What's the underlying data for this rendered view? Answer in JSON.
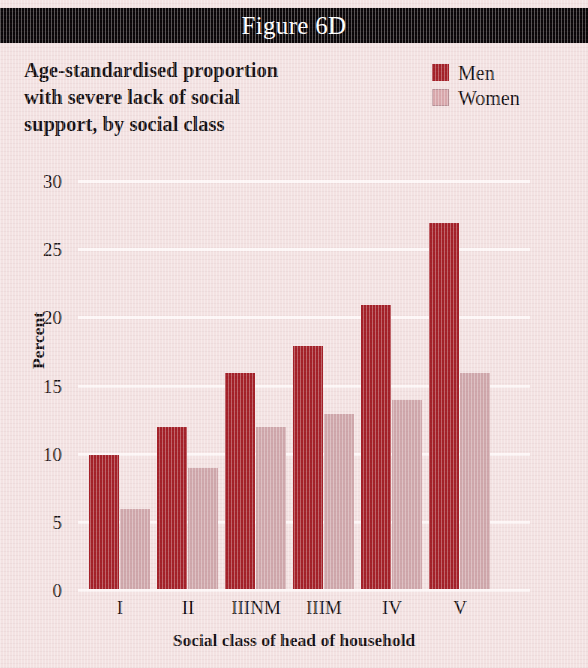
{
  "banner": {
    "title": "Figure 6D"
  },
  "subtitle": {
    "lines": [
      "Age-standardised proportion",
      "with severe lack of social",
      "support, by social class"
    ]
  },
  "legend": {
    "position": "top-right",
    "entries": [
      {
        "label": "Men",
        "color": "#a32028"
      },
      {
        "label": "Women",
        "color": "#d9a8ac"
      }
    ]
  },
  "colors": {
    "background": "#f3e2e2",
    "banner": "#0a0608",
    "gridline": "#fdf6f6",
    "men": "#a32028",
    "women": "#cfa7ab",
    "text": "#161012"
  },
  "chart_data": {
    "type": "bar",
    "title": "Figure 6D",
    "subtitle": "Age-standardised proportion with severe lack of social support, by social class",
    "categories": [
      "I",
      "II",
      "IIINM",
      "IIIM",
      "IV",
      "V"
    ],
    "series": [
      {
        "name": "Men",
        "color": "#a32028",
        "values": [
          10,
          12,
          16,
          18,
          21,
          27
        ]
      },
      {
        "name": "Women",
        "color": "#cfa7ab",
        "values": [
          6,
          9,
          12,
          13,
          14,
          16
        ]
      }
    ],
    "xlabel": "Social class of head of household",
    "ylabel": "Percent",
    "ylim": [
      0,
      30
    ],
    "yticks": [
      0,
      5,
      10,
      15,
      20,
      25,
      30
    ],
    "ytick_labels": [
      "0",
      "5",
      "10",
      "15",
      "20",
      "25",
      "30"
    ],
    "grid": true,
    "legend_position": "top-right"
  }
}
